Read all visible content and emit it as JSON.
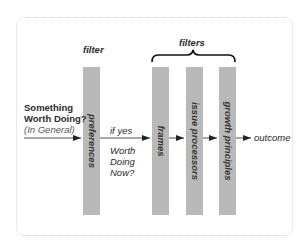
{
  "diagram": {
    "labels": {
      "filter_single": "filter",
      "filters_group": "filters",
      "input_line1": "Something",
      "input_line2": "Worth Doing?",
      "input_qualifier": "(In General)",
      "if_yes": "if yes",
      "question_line1": "Worth",
      "question_line2": "Doing",
      "question_line3": "Now?",
      "outcome": "outcome"
    },
    "bars": [
      {
        "id": "preferences",
        "label": "preferences"
      },
      {
        "id": "frames",
        "label": "frames"
      },
      {
        "id": "issue-processors",
        "label": "issue processors"
      },
      {
        "id": "growth-principles",
        "label": "growth principles"
      }
    ],
    "colors": {
      "bar": "#b9b9b9",
      "arrow": "#222222",
      "frame_border": "#d6d6d6"
    }
  }
}
